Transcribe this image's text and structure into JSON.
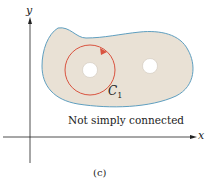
{
  "figure": {
    "axis_x_label": "x",
    "axis_y_label": "y",
    "curve_label": "C",
    "curve_subscript": "1",
    "region_caption": "Not simply connected",
    "figure_label": "(c)",
    "colors": {
      "region_fill": "#e9e1d5",
      "region_outline": "#5f9fc0",
      "curve": "#d9533f",
      "axes": "#222222",
      "hole_fill": "#ffffff"
    }
  }
}
